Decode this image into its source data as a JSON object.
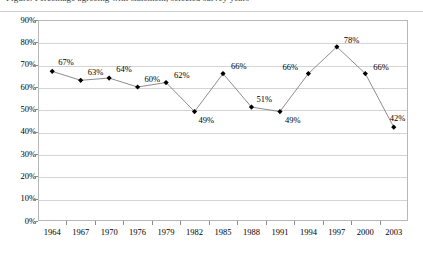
{
  "top_crop_text": "Figure. Percentage agreeing with statement, selected survey years",
  "chart_data": {
    "type": "line",
    "title": "",
    "xlabel": "",
    "ylabel": "",
    "categories": [
      "1964",
      "1967",
      "1970",
      "1976",
      "1979",
      "1982",
      "1985",
      "1988",
      "1991",
      "1994",
      "1997",
      "2000",
      "2003"
    ],
    "values": [
      67,
      63,
      64,
      60,
      62,
      49,
      66,
      51,
      49,
      66,
      78,
      66,
      42
    ],
    "data_labels": [
      "67%",
      "63%",
      "64%",
      "60%",
      "62%",
      "49%",
      "66%",
      "51%",
      "49%",
      "66%",
      "78%",
      "66%",
      "42%"
    ],
    "ylim": [
      0,
      90
    ],
    "ytick_values": [
      0,
      10,
      20,
      30,
      40,
      50,
      60,
      70,
      80,
      90
    ],
    "ytick_labels": [
      "0%",
      "10%",
      "20%",
      "30%",
      "40%",
      "50%",
      "60%",
      "70%",
      "80%",
      "90%"
    ],
    "grid": true,
    "legend": "none",
    "marker": "diamond",
    "marker_color": "#000000",
    "line_color": "#808080"
  },
  "label_offsets": [
    {
      "dx": 6,
      "dy": -13
    },
    {
      "dx": 7,
      "dy": -12
    },
    {
      "dx": 7,
      "dy": -13
    },
    {
      "dx": 7,
      "dy": -12
    },
    {
      "dx": 8,
      "dy": -12
    },
    {
      "dx": 4,
      "dy": 4
    },
    {
      "dx": 8,
      "dy": -12
    },
    {
      "dx": 5,
      "dy": -12
    },
    {
      "dx": 5,
      "dy": 4
    },
    {
      "dx": -26,
      "dy": -11
    },
    {
      "dx": 7,
      "dy": -11
    },
    {
      "dx": 8,
      "dy": -11
    },
    {
      "dx": -4,
      "dy": -13
    }
  ]
}
